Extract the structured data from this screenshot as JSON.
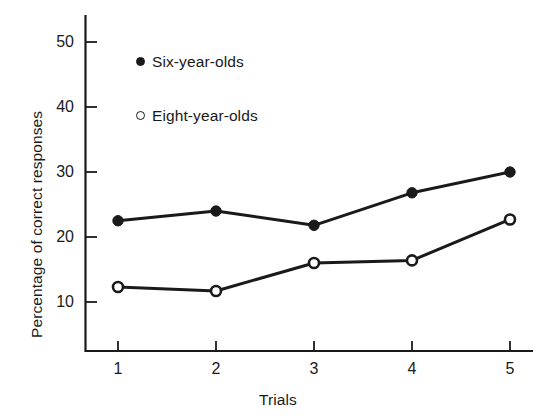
{
  "chart_data": {
    "type": "line",
    "title": "",
    "xlabel": "Trials",
    "ylabel": "Percentage of correct responses",
    "x": [
      1,
      2,
      3,
      4,
      5
    ],
    "categories": [
      "1",
      "2",
      "3",
      "4",
      "5"
    ],
    "xtick_labels": [
      "1",
      "2",
      "3",
      "4",
      "5"
    ],
    "ytick_labels": [
      "10",
      "20",
      "30",
      "40",
      "50"
    ],
    "ytick_values": [
      10,
      20,
      30,
      40,
      50
    ],
    "xlim": [
      0.6,
      5.35
    ],
    "ylim": [
      5.5,
      53.5
    ],
    "grid": false,
    "legend_position": "upper-left-inside",
    "series": [
      {
        "name": "Six-year-olds",
        "marker": "filled-circle",
        "color": "#1a1a1a",
        "values": [
          22.5,
          24.0,
          21.8,
          26.8,
          30.0
        ]
      },
      {
        "name": "Eight-year-olds",
        "marker": "open-circle",
        "color": "#1a1a1a",
        "values": [
          12.3,
          11.7,
          16.0,
          16.4,
          22.7
        ]
      }
    ]
  },
  "axes": {
    "y_axis_title": "Percentage of correct responses",
    "x_axis_title": "Trials",
    "y_ticks": [
      {
        "label": "50",
        "value": 50
      },
      {
        "label": "40",
        "value": 40
      },
      {
        "label": "30",
        "value": 30
      },
      {
        "label": "20",
        "value": 20
      },
      {
        "label": "10",
        "value": 10
      }
    ],
    "x_ticks": [
      {
        "label": "1",
        "value": 1
      },
      {
        "label": "2",
        "value": 2
      },
      {
        "label": "3",
        "value": 3
      },
      {
        "label": "4",
        "value": 4
      },
      {
        "label": "5",
        "value": 5
      }
    ]
  },
  "legend": {
    "items": [
      {
        "label": "Six-year-olds",
        "marker": "filled-circle"
      },
      {
        "label": "Eight-year-olds",
        "marker": "open-circle"
      }
    ]
  },
  "colors": {
    "ink": "#1a1a1a",
    "background": "#ffffff"
  }
}
